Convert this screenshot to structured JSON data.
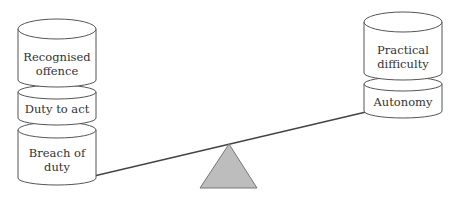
{
  "diagram": {
    "type": "balance-scale",
    "colors": {
      "stroke": "#555555",
      "fulcrum": "#bdbdbd",
      "text": "#333333",
      "background": "#ffffff"
    },
    "left_stack": {
      "cylinders": [
        {
          "lines": [
            "Recognised",
            "offence"
          ]
        },
        {
          "lines": [
            "Duty to act"
          ]
        },
        {
          "lines": [
            "Breach of",
            "duty"
          ]
        }
      ]
    },
    "right_stack": {
      "cylinders": [
        {
          "lines": [
            "Practical",
            "difficulty"
          ]
        },
        {
          "lines": [
            "Autonomy"
          ]
        }
      ]
    }
  }
}
